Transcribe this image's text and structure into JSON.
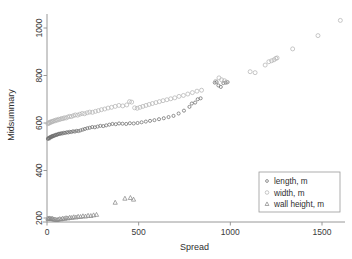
{
  "chart_data": {
    "type": "scatter",
    "title": "",
    "xlabel": "Spread",
    "ylabel": "Midsummary",
    "xlim": [
      -40,
      1680
    ],
    "ylim": [
      160,
      1060
    ],
    "xticks": [
      0,
      500,
      1000,
      1500
    ],
    "yticks": [
      200,
      400,
      600,
      800,
      1000
    ],
    "xticklabels": [
      "0",
      "500",
      "1000",
      "1500"
    ],
    "yticklabels": [
      "200",
      "400",
      "600",
      "800",
      "1000"
    ],
    "grid": false,
    "legend_position": "lower-right",
    "series": [
      {
        "name": "length, m",
        "marker": "circle-small",
        "color": "#6e6e6e",
        "points": [
          [
            5,
            533
          ],
          [
            8,
            536
          ],
          [
            11,
            538
          ],
          [
            14,
            535
          ],
          [
            17,
            540
          ],
          [
            21,
            542
          ],
          [
            25,
            541
          ],
          [
            28,
            545
          ],
          [
            32,
            544
          ],
          [
            36,
            547
          ],
          [
            40,
            546
          ],
          [
            45,
            549
          ],
          [
            50,
            551
          ],
          [
            55,
            550
          ],
          [
            60,
            553
          ],
          [
            66,
            555
          ],
          [
            72,
            554
          ],
          [
            78,
            557
          ],
          [
            85,
            556
          ],
          [
            92,
            559
          ],
          [
            100,
            558
          ],
          [
            108,
            561
          ],
          [
            116,
            560
          ],
          [
            124,
            563
          ],
          [
            133,
            562
          ],
          [
            142,
            565
          ],
          [
            152,
            564
          ],
          [
            162,
            567
          ],
          [
            172,
            566
          ],
          [
            183,
            569
          ],
          [
            195,
            572
          ],
          [
            207,
            575
          ],
          [
            220,
            578
          ],
          [
            233,
            580
          ],
          [
            247,
            583
          ],
          [
            261,
            582
          ],
          [
            276,
            585
          ],
          [
            291,
            588
          ],
          [
            307,
            587
          ],
          [
            323,
            590
          ],
          [
            340,
            593
          ],
          [
            357,
            596
          ],
          [
            375,
            595
          ],
          [
            393,
            598
          ],
          [
            412,
            597
          ],
          [
            432,
            596
          ],
          [
            452,
            599
          ],
          [
            473,
            598
          ],
          [
            494,
            600
          ],
          [
            516,
            603
          ],
          [
            539,
            606
          ],
          [
            562,
            609
          ],
          [
            586,
            612
          ],
          [
            611,
            616
          ],
          [
            637,
            620
          ],
          [
            663,
            625
          ],
          [
            690,
            630
          ],
          [
            718,
            640
          ],
          [
            747,
            652
          ],
          [
            777,
            668
          ],
          [
            790,
            682
          ],
          [
            808,
            686
          ],
          [
            822,
            700
          ],
          [
            838,
            704
          ],
          [
            915,
            770
          ],
          [
            925,
            772
          ],
          [
            935,
            758
          ],
          [
            948,
            752
          ],
          [
            962,
            768
          ],
          [
            975,
            770
          ],
          [
            985,
            772
          ]
        ]
      },
      {
        "name": "width, m",
        "marker": "circle",
        "color": "#b4b4b4",
        "points": [
          [
            5,
            597
          ],
          [
            9,
            601
          ],
          [
            13,
            600
          ],
          [
            17,
            604
          ],
          [
            22,
            603
          ],
          [
            27,
            607
          ],
          [
            32,
            606
          ],
          [
            38,
            610
          ],
          [
            44,
            609
          ],
          [
            50,
            613
          ],
          [
            57,
            612
          ],
          [
            64,
            616
          ],
          [
            71,
            615
          ],
          [
            79,
            619
          ],
          [
            87,
            618
          ],
          [
            95,
            622
          ],
          [
            104,
            621
          ],
          [
            113,
            625
          ],
          [
            123,
            628
          ],
          [
            133,
            627
          ],
          [
            144,
            631
          ],
          [
            155,
            634
          ],
          [
            167,
            633
          ],
          [
            179,
            637
          ],
          [
            192,
            640
          ],
          [
            205,
            639
          ],
          [
            219,
            643
          ],
          [
            233,
            646
          ],
          [
            248,
            645
          ],
          [
            264,
            649
          ],
          [
            280,
            652
          ],
          [
            297,
            656
          ],
          [
            315,
            659
          ],
          [
            333,
            663
          ],
          [
            352,
            666
          ],
          [
            372,
            670
          ],
          [
            392,
            674
          ],
          [
            413,
            672
          ],
          [
            435,
            676
          ],
          [
            450,
            690
          ],
          [
            462,
            688
          ],
          [
            478,
            664
          ],
          [
            492,
            662
          ],
          [
            507,
            666
          ],
          [
            523,
            670
          ],
          [
            540,
            674
          ],
          [
            557,
            678
          ],
          [
            575,
            682
          ],
          [
            594,
            686
          ],
          [
            613,
            690
          ],
          [
            633,
            694
          ],
          [
            654,
            698
          ],
          [
            675,
            702
          ],
          [
            697,
            706
          ],
          [
            720,
            712
          ],
          [
            744,
            716
          ],
          [
            768,
            722
          ],
          [
            793,
            728
          ],
          [
            818,
            734
          ],
          [
            843,
            738
          ],
          [
            920,
            775
          ],
          [
            938,
            790
          ],
          [
            952,
            782
          ],
          [
            968,
            778
          ],
          [
            980,
            772
          ],
          [
            1108,
            816
          ],
          [
            1135,
            812
          ],
          [
            1190,
            844
          ],
          [
            1210,
            858
          ],
          [
            1225,
            862
          ],
          [
            1238,
            866
          ],
          [
            1248,
            872
          ],
          [
            1255,
            874
          ],
          [
            1340,
            912
          ],
          [
            1478,
            968
          ],
          [
            1600,
            1032
          ]
        ]
      },
      {
        "name": "wall height, m",
        "marker": "triangle",
        "color": "#8a8a8a",
        "points": [
          [
            5,
            198
          ],
          [
            9,
            196
          ],
          [
            13,
            199
          ],
          [
            18,
            197
          ],
          [
            23,
            196
          ],
          [
            28,
            198
          ],
          [
            34,
            195
          ],
          [
            40,
            194
          ],
          [
            47,
            193
          ],
          [
            54,
            192
          ],
          [
            61,
            194
          ],
          [
            69,
            196
          ],
          [
            77,
            195
          ],
          [
            86,
            198
          ],
          [
            95,
            197
          ],
          [
            104,
            200
          ],
          [
            114,
            199
          ],
          [
            124,
            202
          ],
          [
            135,
            201
          ],
          [
            146,
            204
          ],
          [
            158,
            203
          ],
          [
            170,
            206
          ],
          [
            183,
            205
          ],
          [
            196,
            208
          ],
          [
            210,
            207
          ],
          [
            224,
            210
          ],
          [
            239,
            209
          ],
          [
            254,
            212
          ],
          [
            270,
            214
          ],
          [
            372,
            265
          ],
          [
            425,
            282
          ],
          [
            455,
            285
          ],
          [
            472,
            278
          ]
        ]
      }
    ]
  },
  "axes": {
    "y_title": "Midsummary",
    "x_title": "Spread"
  },
  "legend": {
    "items": [
      {
        "label": "length, m",
        "marker": "circle-small-marker"
      },
      {
        "label": "width, m",
        "marker": "circle-marker"
      },
      {
        "label": "wall-height, m",
        "marker": "triangle-marker"
      }
    ]
  }
}
